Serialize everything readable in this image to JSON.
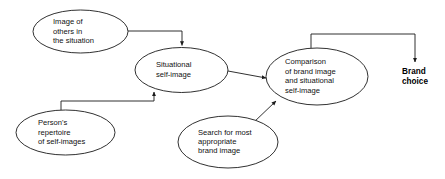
{
  "diagram": {
    "type": "flowchart",
    "background_color": "#ffffff",
    "line_color": "#1a1a1a",
    "text_color": "#111111",
    "nodes": [
      {
        "id": "image-of-others",
        "shape": "ellipse",
        "lines": [
          "Image of",
          "others in",
          "the situation"
        ]
      },
      {
        "id": "situational-self-image",
        "shape": "ellipse",
        "lines": [
          "Situational",
          "self-image"
        ]
      },
      {
        "id": "comparison",
        "shape": "ellipse",
        "lines": [
          "Comparison",
          "of brand image",
          "and situational",
          "self-image"
        ]
      },
      {
        "id": "persons-repertoire",
        "shape": "ellipse",
        "lines": [
          "Person's",
          "repertoire",
          "of self-images"
        ]
      },
      {
        "id": "search-brand-image",
        "shape": "ellipse",
        "lines": [
          "Search for most",
          "appropriate",
          "brand image"
        ]
      },
      {
        "id": "brand-choice",
        "shape": "text",
        "bold": true,
        "lines": [
          "Brand",
          "choice"
        ]
      }
    ],
    "edges": [
      {
        "id": "edge-others-to-situational",
        "from": "image-of-others",
        "to": "situational-self-image",
        "style": "orthogonal",
        "arrow": "end"
      },
      {
        "id": "edge-repertoire-to-situational",
        "from": "persons-repertoire",
        "to": "situational-self-image",
        "style": "orthogonal",
        "arrow": "end"
      },
      {
        "id": "edge-situational-to-comparison",
        "from": "situational-self-image",
        "to": "comparison",
        "style": "straight",
        "arrow": "end"
      },
      {
        "id": "edge-search-to-comparison",
        "from": "search-brand-image",
        "to": "comparison",
        "style": "straight",
        "arrow": "end"
      },
      {
        "id": "edge-comparison-to-brand-choice",
        "from": "comparison",
        "to": "brand-choice",
        "style": "orthogonal",
        "arrow": "end"
      }
    ]
  }
}
